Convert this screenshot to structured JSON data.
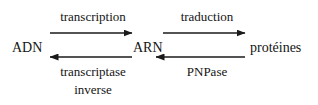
{
  "diagram": {
    "background_color": "#ffffff",
    "stroke_color": "#1a1a1a",
    "nodes": [
      {
        "id": "adn",
        "label": "ADN"
      },
      {
        "id": "arn",
        "label": "ARN"
      },
      {
        "id": "proteines",
        "label": "protéines"
      }
    ],
    "edges": [
      {
        "id": "transcription",
        "label": "transcription",
        "from": "ADN",
        "to": "ARN",
        "direction": "right",
        "position": "above"
      },
      {
        "id": "traduction",
        "label": "traduction",
        "from": "ARN",
        "to": "protéines",
        "direction": "right",
        "position": "above"
      },
      {
        "id": "transcriptase-inverse",
        "label_line1": "transcriptase",
        "label_line2": "inverse",
        "from": "ARN",
        "to": "ADN",
        "direction": "left",
        "position": "below"
      },
      {
        "id": "pnpase",
        "label": "PNPase",
        "from": "protéines",
        "to": "ARN",
        "direction": "left",
        "position": "below"
      }
    ]
  }
}
